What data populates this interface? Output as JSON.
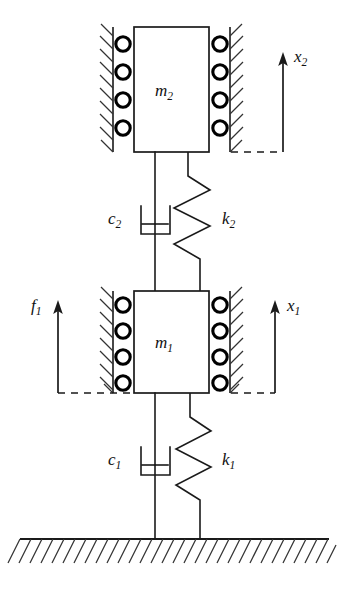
{
  "figure": {
    "background_color": "#ffffff",
    "line_color": "#1a1a1a"
  },
  "masses": [
    {
      "id": "m2",
      "label": "m",
      "subscript": "2",
      "position": "upper",
      "rollers_per_side": 4,
      "walls": [
        "left",
        "right"
      ]
    },
    {
      "id": "m1",
      "label": "m",
      "subscript": "1",
      "position": "lower",
      "rollers_per_side": 4,
      "walls": [
        "left",
        "right"
      ]
    }
  ],
  "dampers": [
    {
      "id": "c2",
      "label": "c",
      "subscript": "2",
      "connects": "m2-to-m1",
      "symbol": "dashpot-icon"
    },
    {
      "id": "c1",
      "label": "c",
      "subscript": "1",
      "connects": "m1-to-ground",
      "symbol": "dashpot-icon"
    }
  ],
  "springs": [
    {
      "id": "k2",
      "label": "k",
      "subscript": "2",
      "connects": "m2-to-m1",
      "symbol": "spring-icon",
      "coils": 3
    },
    {
      "id": "k1",
      "label": "k",
      "subscript": "1",
      "connects": "m1-to-ground",
      "symbol": "spring-icon",
      "coils": 3
    }
  ],
  "displacements": [
    {
      "id": "x2",
      "label": "x",
      "subscript": "2",
      "direction": "up",
      "reference": "m2-bottom-edge",
      "side": "right"
    },
    {
      "id": "x1",
      "label": "x",
      "subscript": "1",
      "direction": "up",
      "reference": "m1-bottom-edge",
      "side": "right"
    }
  ],
  "forces": [
    {
      "id": "f1",
      "label": "f",
      "subscript": "1",
      "direction": "up",
      "applied_to": "m1",
      "side": "left"
    }
  ],
  "ground": {
    "id": "ground",
    "style": "hatched",
    "position": "bottom"
  }
}
